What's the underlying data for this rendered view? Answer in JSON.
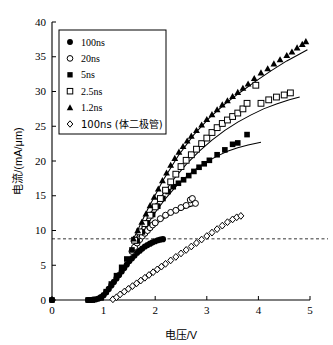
{
  "chart_data": {
    "type": "scatter",
    "title": "",
    "xlabel": "电压/V",
    "ylabel": "电流/(mA/μm)",
    "xlim": [
      0,
      5
    ],
    "ylim": [
      0,
      40
    ],
    "xticks": [
      "0",
      "1",
      "2",
      "3",
      "4",
      "5"
    ],
    "yticks": [
      "0",
      "5",
      "10",
      "15",
      "20",
      "25",
      "30",
      "35",
      "40"
    ],
    "grid": false,
    "legend_position": "upper-left",
    "annotations": [
      {
        "name": "threshold-dashed-line",
        "type": "hline",
        "y": 8.8,
        "style": "dashed"
      }
    ],
    "series": [
      {
        "name": "100ns",
        "marker": "filled-circle",
        "color": "#000000",
        "points": [
          [
            0.0,
            0.0
          ],
          [
            0.7,
            0.0
          ],
          [
            0.75,
            0.0
          ],
          [
            0.8,
            0.05
          ],
          [
            0.85,
            0.1
          ],
          [
            0.9,
            0.2
          ],
          [
            0.95,
            0.4
          ],
          [
            1.0,
            0.7
          ],
          [
            1.05,
            1.1
          ],
          [
            1.1,
            1.6
          ],
          [
            1.15,
            2.1
          ],
          [
            1.2,
            2.6
          ],
          [
            1.25,
            3.1
          ],
          [
            1.3,
            3.6
          ],
          [
            1.35,
            4.1
          ],
          [
            1.4,
            4.6
          ],
          [
            1.45,
            5.1
          ],
          [
            1.5,
            5.6
          ],
          [
            1.55,
            6.0
          ],
          [
            1.6,
            6.4
          ],
          [
            1.65,
            6.8
          ],
          [
            1.7,
            7.1
          ],
          [
            1.75,
            7.4
          ],
          [
            1.8,
            7.7
          ],
          [
            1.85,
            7.9
          ],
          [
            1.9,
            8.1
          ],
          [
            1.95,
            8.3
          ],
          [
            2.0,
            8.45
          ],
          [
            2.05,
            8.6
          ],
          [
            2.1,
            8.7
          ],
          [
            2.15,
            8.75
          ]
        ]
      },
      {
        "name": "20ns",
        "marker": "open-circle",
        "color": "#000000",
        "points": [
          [
            1.55,
            7.0
          ],
          [
            1.6,
            7.6
          ],
          [
            1.65,
            8.2
          ],
          [
            1.7,
            8.7
          ],
          [
            1.75,
            9.2
          ],
          [
            1.8,
            9.6
          ],
          [
            1.85,
            10.0
          ],
          [
            1.9,
            10.4
          ],
          [
            1.95,
            10.8
          ],
          [
            2.0,
            11.1
          ],
          [
            2.1,
            11.7
          ],
          [
            2.2,
            12.2
          ],
          [
            2.3,
            12.6
          ],
          [
            2.4,
            12.9
          ],
          [
            2.5,
            13.3
          ],
          [
            2.6,
            13.6
          ],
          [
            2.68,
            14.4
          ],
          [
            2.72,
            14.6
          ],
          [
            2.78,
            13.9
          ]
        ]
      },
      {
        "name": "5ns",
        "marker": "filled-square",
        "color": "#000000",
        "points": [
          [
            0.0,
            0.0
          ],
          [
            0.7,
            0.0
          ],
          [
            0.78,
            0.0
          ],
          [
            0.95,
            0.3
          ],
          [
            1.05,
            1.2
          ],
          [
            1.15,
            2.3
          ],
          [
            1.25,
            3.5
          ],
          [
            1.35,
            4.7
          ],
          [
            1.45,
            5.9
          ],
          [
            1.55,
            7.2
          ],
          [
            1.65,
            8.5
          ],
          [
            1.75,
            9.8
          ],
          [
            1.85,
            11.1
          ],
          [
            1.95,
            12.3
          ],
          [
            2.05,
            13.5
          ],
          [
            2.15,
            14.6
          ],
          [
            2.25,
            15.6
          ],
          [
            2.35,
            16.3
          ],
          [
            2.45,
            16.8
          ],
          [
            2.55,
            17.3
          ],
          [
            2.65,
            17.9
          ],
          [
            2.75,
            18.5
          ],
          [
            2.85,
            19.1
          ],
          [
            2.95,
            19.6
          ],
          [
            3.05,
            20.1
          ],
          [
            3.2,
            20.9
          ],
          [
            3.35,
            21.6
          ],
          [
            3.5,
            22.4
          ],
          [
            3.6,
            22.6
          ],
          [
            3.78,
            23.8
          ]
        ]
      },
      {
        "name": "2.5ns",
        "marker": "open-square",
        "color": "#000000",
        "points": [
          [
            1.6,
            8.6
          ],
          [
            1.7,
            9.8
          ],
          [
            1.8,
            11.0
          ],
          [
            1.9,
            12.2
          ],
          [
            2.0,
            13.4
          ],
          [
            2.1,
            14.6
          ],
          [
            2.2,
            15.8
          ],
          [
            2.3,
            17.0
          ],
          [
            2.4,
            18.1
          ],
          [
            2.5,
            19.2
          ],
          [
            2.6,
            20.1
          ],
          [
            2.7,
            20.9
          ],
          [
            2.8,
            21.7
          ],
          [
            2.9,
            22.5
          ],
          [
            3.0,
            23.3
          ],
          [
            3.1,
            24.1
          ],
          [
            3.2,
            24.8
          ],
          [
            3.3,
            25.4
          ],
          [
            3.4,
            25.9
          ],
          [
            3.5,
            26.4
          ],
          [
            3.6,
            26.9
          ],
          [
            3.7,
            27.5
          ],
          [
            3.78,
            28.3
          ],
          [
            3.95,
            30.9
          ],
          [
            4.05,
            28.3
          ],
          [
            4.2,
            28.8
          ],
          [
            4.35,
            29.2
          ],
          [
            4.5,
            29.5
          ],
          [
            4.62,
            29.8
          ]
        ]
      },
      {
        "name": "1.2ns",
        "marker": "filled-triangle",
        "color": "#000000",
        "points": [
          [
            1.58,
            8.8
          ],
          [
            1.66,
            10.0
          ],
          [
            1.74,
            11.2
          ],
          [
            1.82,
            12.4
          ],
          [
            1.9,
            13.6
          ],
          [
            1.98,
            14.8
          ],
          [
            2.06,
            16.0
          ],
          [
            2.14,
            17.2
          ],
          [
            2.22,
            18.3
          ],
          [
            2.3,
            19.4
          ],
          [
            2.38,
            20.4
          ],
          [
            2.46,
            21.3
          ],
          [
            2.54,
            22.1
          ],
          [
            2.62,
            22.9
          ],
          [
            2.7,
            23.6
          ],
          [
            2.8,
            24.4
          ],
          [
            2.9,
            25.2
          ],
          [
            3.0,
            26.0
          ],
          [
            3.1,
            26.7
          ],
          [
            3.2,
            27.4
          ],
          [
            3.3,
            28.1
          ],
          [
            3.4,
            28.7
          ],
          [
            3.5,
            29.3
          ],
          [
            3.6,
            29.9
          ],
          [
            3.7,
            30.5
          ],
          [
            3.8,
            31.1
          ],
          [
            3.92,
            31.9
          ],
          [
            4.05,
            32.7
          ],
          [
            4.18,
            33.3
          ],
          [
            4.3,
            34.0
          ],
          [
            4.42,
            34.6
          ],
          [
            4.55,
            35.2
          ],
          [
            4.65,
            35.7
          ],
          [
            4.75,
            36.3
          ],
          [
            4.85,
            36.8
          ],
          [
            4.92,
            37.2
          ]
        ]
      },
      {
        "name": "100ns (体二极管)",
        "marker": "open-diamond",
        "color": "#000000",
        "points": [
          [
            1.18,
            0.1
          ],
          [
            1.25,
            0.4
          ],
          [
            1.32,
            0.8
          ],
          [
            1.4,
            1.2
          ],
          [
            1.48,
            1.6
          ],
          [
            1.56,
            2.0
          ],
          [
            1.64,
            2.4
          ],
          [
            1.72,
            2.8
          ],
          [
            1.8,
            3.2
          ],
          [
            1.88,
            3.6
          ],
          [
            1.96,
            4.0
          ],
          [
            2.04,
            4.4
          ],
          [
            2.12,
            4.8
          ],
          [
            2.2,
            5.2
          ],
          [
            2.3,
            5.7
          ],
          [
            2.4,
            6.2
          ],
          [
            2.5,
            6.7
          ],
          [
            2.6,
            7.2
          ],
          [
            2.7,
            7.7
          ],
          [
            2.8,
            8.2
          ],
          [
            2.9,
            8.7
          ],
          [
            3.0,
            9.2
          ],
          [
            3.1,
            9.7
          ],
          [
            3.2,
            10.2
          ],
          [
            3.3,
            10.7
          ],
          [
            3.4,
            11.2
          ],
          [
            3.5,
            11.6
          ],
          [
            3.58,
            11.9
          ],
          [
            3.66,
            12.1
          ]
        ]
      }
    ],
    "fit_curves": [
      {
        "name": "fit-20ns",
        "points": [
          [
            1.62,
            7.5
          ],
          [
            1.75,
            9.0
          ],
          [
            1.9,
            10.2
          ],
          [
            2.05,
            11.1
          ],
          [
            2.2,
            11.9
          ],
          [
            2.35,
            12.5
          ],
          [
            2.5,
            13.0
          ],
          [
            2.65,
            13.4
          ],
          [
            2.8,
            13.7
          ]
        ]
      },
      {
        "name": "fit-5ns",
        "points": [
          [
            1.8,
            10.3
          ],
          [
            2.0,
            12.6
          ],
          [
            2.2,
            14.6
          ],
          [
            2.4,
            16.3
          ],
          [
            2.6,
            17.7
          ],
          [
            2.8,
            18.9
          ],
          [
            3.0,
            19.9
          ],
          [
            3.2,
            20.7
          ],
          [
            3.4,
            21.4
          ],
          [
            3.6,
            21.9
          ],
          [
            3.8,
            22.3
          ],
          [
            4.05,
            22.7
          ]
        ]
      },
      {
        "name": "fit-2.5ns",
        "points": [
          [
            1.62,
            8.8
          ],
          [
            1.85,
            11.8
          ],
          [
            2.1,
            14.7
          ],
          [
            2.35,
            17.3
          ],
          [
            2.6,
            19.5
          ],
          [
            2.85,
            21.4
          ],
          [
            3.1,
            23.0
          ],
          [
            3.35,
            24.4
          ],
          [
            3.6,
            25.6
          ],
          [
            3.85,
            26.6
          ],
          [
            4.1,
            27.5
          ],
          [
            4.35,
            28.2
          ],
          [
            4.6,
            28.8
          ],
          [
            4.8,
            29.2
          ]
        ]
      },
      {
        "name": "fit-1.2ns",
        "points": [
          [
            1.58,
            8.8
          ],
          [
            1.85,
            13.0
          ],
          [
            2.15,
            17.2
          ],
          [
            2.45,
            20.8
          ],
          [
            2.75,
            23.8
          ],
          [
            3.05,
            26.2
          ],
          [
            3.35,
            28.2
          ],
          [
            3.65,
            29.9
          ],
          [
            3.95,
            31.5
          ],
          [
            4.25,
            33.0
          ],
          [
            4.55,
            34.4
          ],
          [
            4.8,
            35.4
          ],
          [
            4.95,
            36.0
          ]
        ]
      }
    ],
    "legend": [
      {
        "label": "100ns",
        "marker": "filled-circle"
      },
      {
        "label": "20ns",
        "marker": "open-circle"
      },
      {
        "label": "5ns",
        "marker": "filled-square"
      },
      {
        "label": "2.5ns",
        "marker": "open-square"
      },
      {
        "label": "1.2ns",
        "marker": "filled-triangle"
      },
      {
        "label": "100ns (体二极管)",
        "marker": "open-diamond"
      }
    ]
  }
}
